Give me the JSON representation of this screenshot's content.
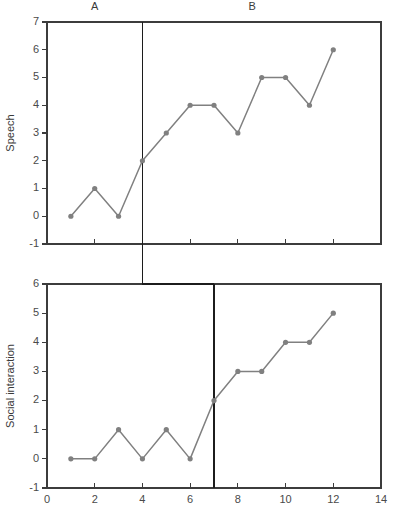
{
  "figure": {
    "background": "#ffffff",
    "line_color": "#808080",
    "marker_color": "#808080",
    "axis_color": "#3c3c3c",
    "phase_line_color": "#1c1c1c"
  },
  "chart_data": [
    {
      "type": "line",
      "name": "speech-panel",
      "title": "",
      "xlabel": "",
      "ylabel": "Speech",
      "xlim": [
        0,
        14
      ],
      "ylim": [
        -1,
        7
      ],
      "xticks": [
        0,
        2,
        4,
        6,
        8,
        10,
        12,
        14
      ],
      "xticklabels": [
        "",
        "",
        "",
        "",
        "",
        "",
        "",
        ""
      ],
      "yticks": [
        -1,
        0,
        1,
        2,
        3,
        4,
        5,
        6,
        7
      ],
      "yticklabels": [
        "-1",
        "0",
        "1",
        "2",
        "3",
        "4",
        "5",
        "6",
        "7"
      ],
      "grid": false,
      "legend": "none",
      "x": [
        1,
        2,
        3,
        4,
        5,
        6,
        7,
        8,
        9,
        10,
        11,
        12
      ],
      "values": [
        0,
        1,
        0,
        2,
        3,
        4,
        4,
        3,
        5,
        5,
        4,
        6
      ],
      "phase_change_x": 4,
      "annotations": [
        {
          "text": "A",
          "x": 2,
          "y": 7.45
        },
        {
          "text": "B",
          "x": 8.6,
          "y": 7.45
        }
      ]
    },
    {
      "type": "line",
      "name": "social-interaction-panel",
      "title": "",
      "xlabel": "",
      "ylabel": "Social interaction",
      "xlim": [
        0,
        14
      ],
      "ylim": [
        -1,
        6
      ],
      "xticks": [
        0,
        2,
        4,
        6,
        8,
        10,
        12,
        14
      ],
      "xticklabels": [
        "0",
        "2",
        "4",
        "6",
        "8",
        "10",
        "12",
        "14"
      ],
      "yticks": [
        -1,
        0,
        1,
        2,
        3,
        4,
        5,
        6
      ],
      "yticklabels": [
        "-1",
        "0",
        "1",
        "2",
        "3",
        "4",
        "5",
        "6"
      ],
      "grid": false,
      "legend": "none",
      "x": [
        1,
        2,
        3,
        4,
        5,
        6,
        7,
        8,
        9,
        10,
        11,
        12
      ],
      "values": [
        0,
        0,
        1,
        0,
        1,
        0,
        2,
        3,
        3,
        4,
        4,
        5
      ],
      "phase_change_x": 7,
      "annotations": []
    }
  ]
}
